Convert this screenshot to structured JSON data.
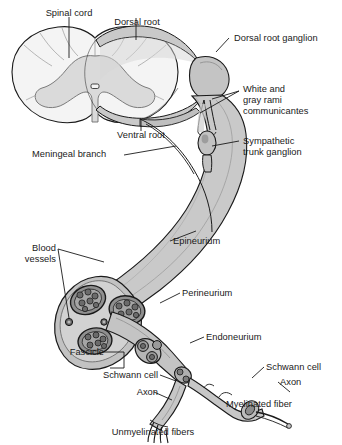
{
  "figure": {
    "type": "anatomical-illustration",
    "palette": {
      "outline": "#1a1a1a",
      "white_matter": "#f2f2f2",
      "gray_matter": "#dcdcdc",
      "nerve_fill": "#c9c9c9",
      "nerve_shade": "#aeaeae",
      "epineurium": "#bdbdbd",
      "fascicle_fill": "#8d8d8d",
      "axon_fill": "#6f6f6f",
      "background": "#ffffff",
      "leader": "#1a1a1a"
    }
  },
  "labels": {
    "spinal_cord": "Spinal cord",
    "dorsal_root": "Dorsal root",
    "dorsal_root_ganglion": "Dorsal root ganglion",
    "white_gray_rami_line1": "White and",
    "white_gray_rami_line2": "gray rami",
    "white_gray_rami_line3": "communicantes",
    "ventral_root": "Ventral root",
    "sympathetic_line1": "Sympathetic",
    "sympathetic_line2": "trunk ganglion",
    "meningeal_branch": "Meningeal branch",
    "epineurium": "Epineurium",
    "blood_vessels_line1": "Blood",
    "blood_vessels_line2": "vessels",
    "perineurium": "Perineurium",
    "endoneurium": "Endoneurium",
    "fascicle": "Fascicle",
    "schwann_cell_right": "Schwann cell",
    "axon_right": "Axon",
    "myelinated_fiber": "Myelinated fiber",
    "schwann_cell_left": "Schwann cell",
    "axon_left": "Axon",
    "unmyelinated_fibers": "Unmyelinated fibers"
  }
}
